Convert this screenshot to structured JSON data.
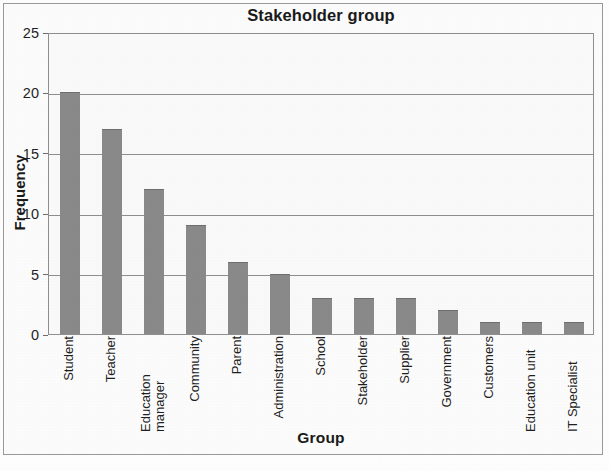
{
  "chart_data": {
    "type": "bar",
    "title": "Stakeholder group",
    "xlabel": "Group",
    "ylabel": "Frequency",
    "categories": [
      "Student",
      "Teacher",
      "Education manager",
      "Community",
      "Parent",
      "Administration",
      "School",
      "Stakeholder",
      "Supplier",
      "Government",
      "Customers",
      "Education unit",
      "IT Specialist"
    ],
    "values": [
      20,
      17,
      12,
      9,
      6,
      5,
      3,
      3,
      3,
      2,
      1,
      1,
      1
    ],
    "ylim": [
      0,
      25
    ],
    "ytick_labels": [
      "25",
      "20",
      "15",
      "10",
      "5",
      "0"
    ],
    "ytick_values": [
      25,
      20,
      15,
      10,
      5,
      0
    ],
    "grid": "horizontal",
    "legend": "none",
    "bar_color": "#8a8a8a",
    "plot_background": "#fbfbfb",
    "axis_color": "#8f8f8f",
    "text_color": "#1a1a1a"
  }
}
